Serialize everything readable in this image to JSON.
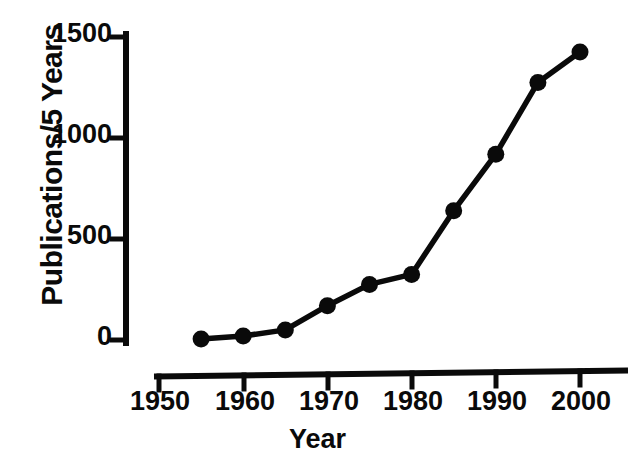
{
  "chart_data": {
    "type": "line",
    "title": "",
    "xlabel": "Year",
    "ylabel": "Publications/5 Years",
    "x": [
      1955,
      1960,
      1965,
      1970,
      1975,
      1980,
      1985,
      1990,
      1995,
      2000
    ],
    "values": [
      5,
      20,
      50,
      170,
      275,
      325,
      640,
      920,
      1275,
      1425
    ],
    "series": [
      {
        "name": "Publications/5 Years",
        "values": [
          5,
          20,
          50,
          170,
          275,
          325,
          640,
          920,
          1275,
          1425
        ]
      }
    ],
    "xlim": [
      1950,
      2003
    ],
    "ylim": [
      0,
      1500
    ],
    "xticks": [
      1950,
      1960,
      1970,
      1980,
      1990,
      2000
    ],
    "xtick_labels": [
      "1950",
      "1960",
      "1970",
      "1980",
      "1990",
      "2000"
    ],
    "yticks": [
      0,
      500,
      1000,
      1500
    ],
    "ytick_labels": [
      "0",
      "500",
      "1000",
      "1500"
    ],
    "grid": false,
    "legend": false,
    "marker": "filled-circle",
    "line_color": "#0a0a0a",
    "marker_color": "#0a0a0a",
    "background_color": "#ffffff"
  }
}
